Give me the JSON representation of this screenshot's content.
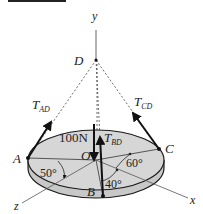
{
  "header_bar": {
    "color": "#222222"
  },
  "axes": {
    "y": "y",
    "x": "x",
    "z": "z"
  },
  "points": {
    "D": "D",
    "A": "A",
    "B": "B",
    "C": "C",
    "O": "O"
  },
  "forces": {
    "t_ad": {
      "main": "T",
      "sub": "AD"
    },
    "t_cd": {
      "main": "T",
      "sub": "CD"
    },
    "t_bd": {
      "main": "T",
      "sub": "BD"
    },
    "weight": "100N"
  },
  "angles": {
    "a": "50°",
    "c": "60°",
    "b": "40°"
  },
  "colors": {
    "disk_fill": "#d4d4d4",
    "disk_edge": "#1a1a1a",
    "line": "#333333"
  }
}
